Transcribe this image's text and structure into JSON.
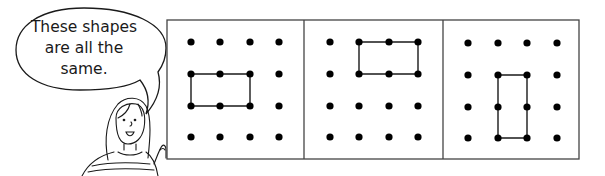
{
  "speech_bubble": {
    "lines": [
      "These shapes",
      "are all the",
      "same."
    ]
  },
  "character": {
    "description": "girl-pointing-at-grids"
  },
  "grids": {
    "dots_per_side": 4,
    "panels": [
      {
        "label": "panel-1",
        "shape": "rectangle",
        "orientation": "horizontal",
        "corners": [
          [
            0,
            1
          ],
          [
            2,
            1
          ],
          [
            2,
            2
          ],
          [
            0,
            2
          ]
        ]
      },
      {
        "label": "panel-2",
        "shape": "rectangle",
        "orientation": "horizontal",
        "corners": [
          [
            1,
            0
          ],
          [
            3,
            0
          ],
          [
            3,
            1
          ],
          [
            1,
            1
          ]
        ]
      },
      {
        "label": "panel-3",
        "shape": "rectangle",
        "orientation": "vertical",
        "corners": [
          [
            1,
            1
          ],
          [
            2,
            1
          ],
          [
            2,
            3
          ],
          [
            1,
            3
          ]
        ]
      }
    ]
  },
  "colors": {
    "line": "#1a1a1a",
    "dot": "#000000",
    "background": "#ffffff"
  }
}
